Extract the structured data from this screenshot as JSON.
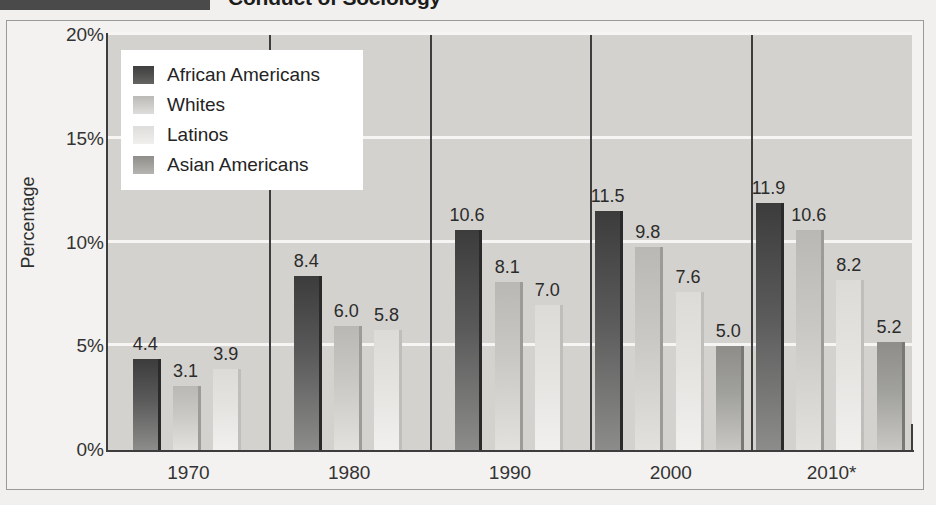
{
  "header": {
    "title_partial": "Conduct of Sociology",
    "rule_color": "#4a4a4a"
  },
  "chart_data": {
    "type": "bar",
    "title": "",
    "xlabel": "",
    "ylabel": "Percentage",
    "categories": [
      "1970",
      "1980",
      "1990",
      "2000",
      "2010*"
    ],
    "ylim": [
      0,
      20
    ],
    "ytick_labels": [
      "0%",
      "5%",
      "10%",
      "15%",
      "20%"
    ],
    "ytick_values": [
      0,
      5,
      10,
      15,
      20
    ],
    "grid": true,
    "legend_position": "upper-left-inside",
    "series": [
      {
        "name": "African Americans",
        "color": "#3c3c3c",
        "values": [
          4.4,
          8.4,
          10.6,
          11.5,
          11.9
        ],
        "labels": [
          "4.4",
          "8.4",
          "10.6",
          "11.5",
          "11.9"
        ]
      },
      {
        "name": "Whites",
        "color": "#c9c8c5",
        "values": [
          3.1,
          6.0,
          8.1,
          9.8,
          10.6
        ],
        "labels": [
          "3.1",
          "6.0",
          "8.1",
          "9.8",
          "10.6"
        ]
      },
      {
        "name": "Latinos",
        "color": "#e4e3e0",
        "values": [
          3.9,
          5.8,
          7.0,
          7.6,
          8.2
        ],
        "labels": [
          "3.9",
          "5.8",
          "7.0",
          "7.6",
          "8.2"
        ]
      },
      {
        "name": "Asian Americans",
        "color": "#a0a09d",
        "values": [
          null,
          null,
          null,
          5.0,
          5.2
        ],
        "labels": [
          "",
          "",
          "",
          "5.0",
          "5.2"
        ]
      }
    ]
  },
  "legend": {
    "items": [
      {
        "label": "African Americans"
      },
      {
        "label": "Whites"
      },
      {
        "label": "Latinos"
      },
      {
        "label": "Asian Americans"
      }
    ]
  }
}
